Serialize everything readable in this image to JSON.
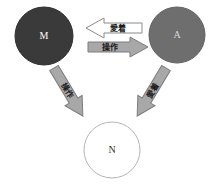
{
  "diagram": {
    "type": "triadic-relationship-diagram",
    "background_color": "#ffffff",
    "nodes": [
      {
        "id": "M",
        "label": "M",
        "shape": "circle",
        "fill": "#3a3a3a",
        "stroke": "#2a2a2a",
        "label_color": "#ffffff",
        "cx": 44,
        "cy": 36,
        "r": 29
      },
      {
        "id": "A",
        "label": "A",
        "shape": "circle",
        "fill": "#6e6e6e",
        "stroke": "#5e5e5e",
        "label_color": "#d8d8d8",
        "cx": 177,
        "cy": 35,
        "r": 28
      },
      {
        "id": "N",
        "label": "N",
        "shape": "circle",
        "fill": "#ffffff",
        "stroke": "#b5b5b5",
        "label_color": "#333333",
        "cx": 112,
        "cy": 150,
        "r": 28
      }
    ],
    "arrows": [
      {
        "id": "a-to-m",
        "label": "愛着",
        "from": "A",
        "to": "M",
        "direction": "left",
        "style": "outline",
        "fill": "#ffffff",
        "stroke": "#808080"
      },
      {
        "id": "m-to-a",
        "label": "操作",
        "from": "M",
        "to": "A",
        "direction": "right",
        "style": "filled",
        "fill": "#a8a8a8",
        "stroke": "#7d7d7d"
      },
      {
        "id": "m-to-n",
        "label": "操作",
        "from": "M",
        "to": "N",
        "direction": "down-right",
        "style": "filled",
        "fill": "#a8a8a8",
        "stroke": "#7d7d7d"
      },
      {
        "id": "a-to-n",
        "label": "愛着",
        "from": "A",
        "to": "N",
        "direction": "down-left",
        "style": "filled",
        "fill": "#a8a8a8",
        "stroke": "#7d7d7d"
      }
    ]
  }
}
